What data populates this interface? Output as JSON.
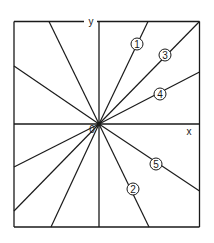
{
  "diagram": {
    "type": "radial-lines-in-frame",
    "origin_label": "0",
    "axes": {
      "x_label": "x",
      "y_label": "y"
    },
    "frame": {
      "left": 14,
      "top": 21.5,
      "right": 199.5,
      "bottom": 227
    },
    "origin": {
      "x": 99,
      "y": 124
    },
    "stroke_color": "#1a1a1a",
    "numbered_lines": [
      {
        "id": "1",
        "label": "1",
        "end": {
          "x": 148,
          "y": 21.5
        },
        "label_pos": {
          "x": 137,
          "y": 44
        }
      },
      {
        "id": "2",
        "label": "2",
        "end": {
          "x": 149,
          "y": 227
        },
        "label_pos": {
          "x": 133,
          "y": 189
        }
      },
      {
        "id": "3",
        "label": "3",
        "end": {
          "x": 199.5,
          "y": 21.5
        },
        "label_pos": {
          "x": 165,
          "y": 55
        }
      },
      {
        "id": "4",
        "label": "4",
        "end": {
          "x": 199.5,
          "y": 72
        },
        "label_pos": {
          "x": 160,
          "y": 94
        }
      },
      {
        "id": "5",
        "label": "5",
        "end": {
          "x": 199.5,
          "y": 191
        },
        "label_pos": {
          "x": 156,
          "y": 164
        }
      }
    ],
    "unlabeled_lines": [
      {
        "end": {
          "x": 49,
          "y": 21.5
        }
      },
      {
        "end": {
          "x": 14,
          "y": 66
        }
      },
      {
        "end": {
          "x": 14,
          "y": 167
        }
      },
      {
        "end": {
          "x": 14,
          "y": 211
        }
      },
      {
        "end": {
          "x": 51,
          "y": 227
        }
      }
    ]
  }
}
